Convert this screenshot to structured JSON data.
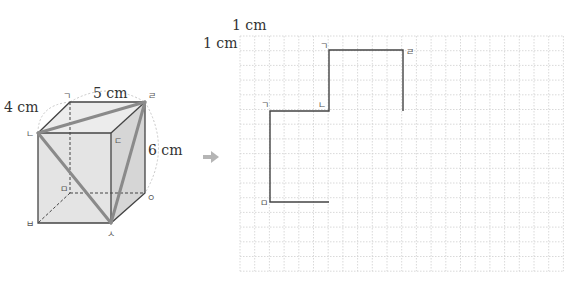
{
  "cube": {
    "labels": {
      "depth": "4 cm",
      "width": "5 cm",
      "height": "6 cm"
    },
    "vertices": {
      "back_top_left": "ㄱ",
      "front_top_left": "ㄴ",
      "front_top_right": "ㄷ",
      "back_top_right": "ㄹ",
      "back_bottom_left": "ㅁ",
      "front_bottom_left": "ㅂ",
      "front_bottom_right": "ㅅ",
      "back_bottom_right": "ㅇ"
    }
  },
  "arrow": {
    "icon": "right-arrow-icon",
    "color": "#b5b5b5"
  },
  "grid": {
    "unit_x_label": "1 cm",
    "unit_y_label": "1 cm",
    "columns": 22,
    "rows": 16,
    "path_labels": {
      "start": "ㅁ",
      "corner1": "ㄱ",
      "corner2": "ㄴ",
      "corner3": "ㄱ",
      "corner4": "ㄹ"
    }
  },
  "colors": {
    "edge": "#444444",
    "highlight": "#8a8a8a",
    "face_front": "#e6e6e6",
    "face_top": "#ededed",
    "face_side": "#d8d8d8",
    "grid_line": "#cfcfcf",
    "path": "#444444"
  }
}
